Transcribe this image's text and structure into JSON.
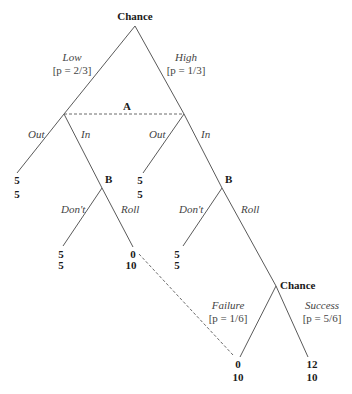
{
  "diagram": {
    "type": "extensive-form game tree",
    "nodes": {
      "root": {
        "label": "Chance"
      },
      "info_set_a": {
        "label": "A"
      },
      "b_left": {
        "label": "B"
      },
      "b_right": {
        "label": "B"
      },
      "chance2": {
        "label": "Chance"
      }
    },
    "branches": {
      "low": {
        "label": "Low",
        "prob": "[p = 2/3]"
      },
      "high": {
        "label": "High",
        "prob": "[p = 1/3]"
      },
      "out_left": {
        "label": "Out"
      },
      "in_left": {
        "label": "In"
      },
      "out_right": {
        "label": "Out"
      },
      "in_right": {
        "label": "In"
      },
      "dont_left": {
        "label": "Don't"
      },
      "roll_left": {
        "label": "Roll"
      },
      "dont_right": {
        "label": "Don't"
      },
      "roll_right": {
        "label": "Roll"
      },
      "failure": {
        "label": "Failure",
        "prob": "[p = 1/6]"
      },
      "success": {
        "label": "Success",
        "prob": "[p = 5/6]"
      }
    },
    "terminals": [
      {
        "id": "low_out",
        "top": "5",
        "bottom": "5"
      },
      {
        "id": "low_in_dont",
        "top": "5",
        "bottom": "5"
      },
      {
        "id": "low_in_roll",
        "top": "0",
        "bottom": "10"
      },
      {
        "id": "high_out",
        "top": "5",
        "bottom": "5"
      },
      {
        "id": "high_in_dont",
        "top": "5",
        "bottom": "5"
      },
      {
        "id": "high_in_roll_failure",
        "top": "0",
        "bottom": "10"
      },
      {
        "id": "high_in_roll_success",
        "top": "12",
        "bottom": "10"
      }
    ]
  }
}
